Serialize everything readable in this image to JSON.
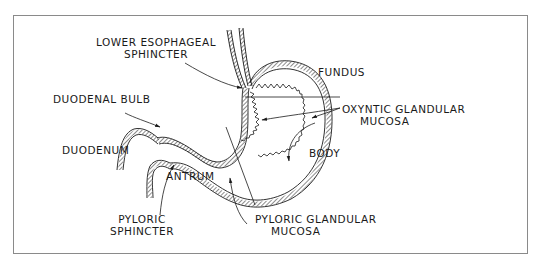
{
  "diagram": {
    "type": "anatomical-line-drawing",
    "colors": {
      "ink": "#1a1a1a",
      "frame": "#8a8a8a",
      "background": "#ffffff"
    },
    "labels": {
      "lower_esophageal_sphincter": {
        "line1": "LOWER ESOPHAGEAL",
        "line2": "SPHINCTER"
      },
      "fundus": "FUNDUS",
      "oxyntic_glandular_mucosa": {
        "line1": "OXYNTIC GLANDULAR",
        "line2": "MUCOSA"
      },
      "duodenal_bulb": "DUODENAL BULB",
      "duodenum": "DUODENUM",
      "body": "BODY",
      "antrum": "ANTRUM",
      "pyloric_sphincter": {
        "line1": "PYLORIC",
        "line2": "SPHINCTER"
      },
      "pyloric_glandular_mucosa": {
        "line1": "PYLORIC GLANDULAR",
        "line2": "MUCOSA"
      }
    }
  }
}
